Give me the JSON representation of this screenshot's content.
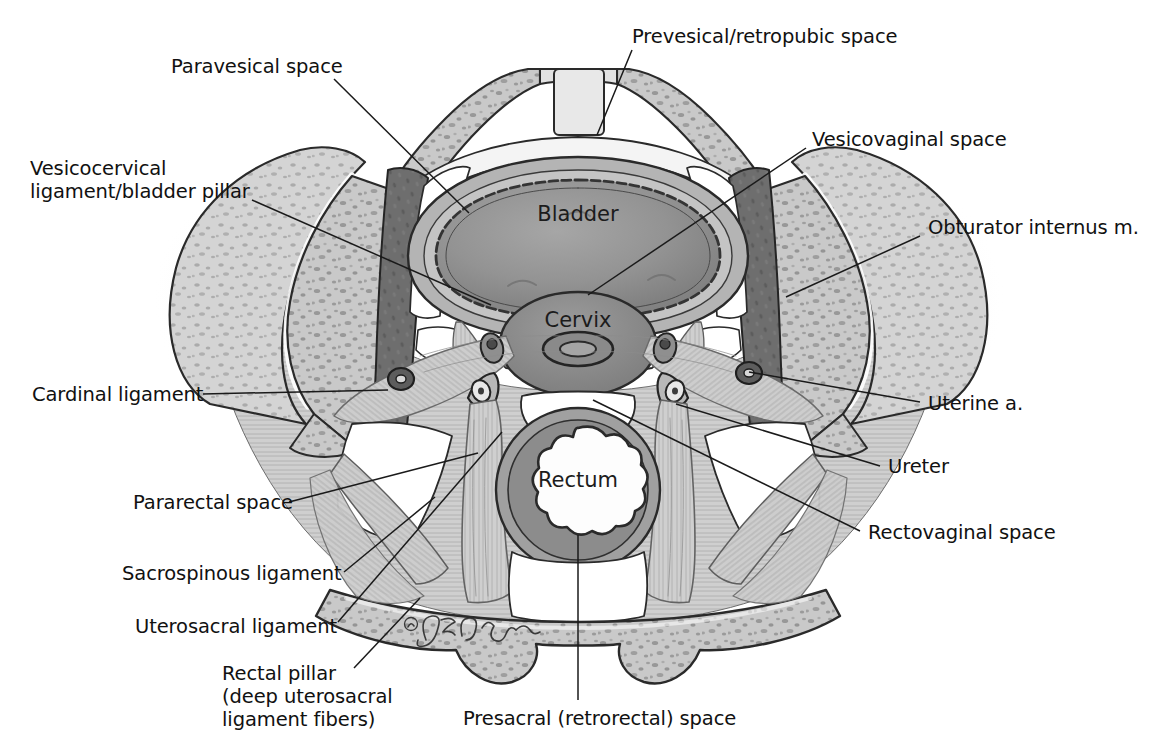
{
  "figure": {
    "signature": "© JE Calver",
    "background_color": "#ffffff",
    "text_color": "#111111",
    "line_color": "#1a1a1a"
  },
  "organ_labels": [
    {
      "id": "bladder",
      "text": "Bladder",
      "x": 578,
      "y": 221
    },
    {
      "id": "cervix",
      "text": "Cervix",
      "x": 578,
      "y": 327
    },
    {
      "id": "rectum",
      "text": "Rectum",
      "x": 578,
      "y": 487
    }
  ],
  "callouts": [
    {
      "id": "paravesical-space",
      "text": "Paravesical space",
      "align": "left",
      "x": 171,
      "y": 55,
      "leader": [
        [
          334,
          79
        ],
        [
          469,
          213
        ]
      ]
    },
    {
      "id": "prevesical-retropubic-space",
      "text": "Prevesical/retropubic space",
      "align": "left",
      "x": 632,
      "y": 25,
      "leader": [
        [
          632,
          50
        ],
        [
          597,
          135
        ]
      ]
    },
    {
      "id": "vesicovaginal-space",
      "text": "Vesicovaginal space",
      "align": "left",
      "x": 812,
      "y": 128,
      "leader": [
        [
          806,
          148
        ],
        [
          588,
          295
        ]
      ]
    },
    {
      "id": "vesicocervical-ligament-bladder-pillar",
      "text": "Vesicocervical\nligament/bladder pillar",
      "align": "left",
      "x": 30,
      "y": 157,
      "leader": [
        [
          252,
          200
        ],
        [
          491,
          305
        ]
      ]
    },
    {
      "id": "obturator-internus-muscle",
      "text": "Obturator internus m.",
      "align": "left",
      "x": 928,
      "y": 216,
      "leader": [
        [
          920,
          236
        ],
        [
          786,
          297
        ]
      ]
    },
    {
      "id": "cardinal-ligament",
      "text": "Cardinal ligament",
      "align": "left",
      "x": 32,
      "y": 383,
      "leader": [
        [
          203,
          394
        ],
        [
          388,
          390
        ]
      ]
    },
    {
      "id": "uterine-artery",
      "text": "Uterine a.",
      "align": "left",
      "x": 928,
      "y": 392,
      "leader": [
        [
          920,
          402
        ],
        [
          749,
          372
        ]
      ]
    },
    {
      "id": "ureter",
      "text": "Ureter",
      "align": "left",
      "x": 888,
      "y": 455,
      "leader": [
        [
          880,
          466
        ],
        [
          676,
          404
        ]
      ]
    },
    {
      "id": "pararectal-space",
      "text": "Pararectal space",
      "align": "left",
      "x": 133,
      "y": 491,
      "leader": [
        [
          289,
          502
        ],
        [
          478,
          453
        ]
      ]
    },
    {
      "id": "rectovaginal-space",
      "text": "Rectovaginal space",
      "align": "left",
      "x": 868,
      "y": 521,
      "leader": [
        [
          860,
          531
        ],
        [
          593,
          400
        ]
      ]
    },
    {
      "id": "sacrospinous-ligament",
      "text": "Sacrospinous ligament",
      "align": "left",
      "x": 122,
      "y": 562,
      "leader": [
        [
          344,
          572
        ],
        [
          435,
          497
        ]
      ]
    },
    {
      "id": "uterosacral-ligament",
      "text": "Uterosacral ligament",
      "align": "left",
      "x": 135,
      "y": 615,
      "leader": [
        [
          338,
          622
        ],
        [
          502,
          432
        ]
      ]
    },
    {
      "id": "rectal-pillar",
      "text": "Rectal pillar\n(deep uterosacral\nligament fibers)",
      "align": "left",
      "x": 222,
      "y": 662,
      "leader": [
        [
          354,
          668
        ],
        [
          420,
          598
        ]
      ]
    },
    {
      "id": "presacral-retrorectal-space",
      "text": "Presacral (retrorectal) space",
      "align": "left",
      "x": 463,
      "y": 707,
      "leader": [
        [
          578,
          700
        ],
        [
          578,
          535
        ]
      ]
    }
  ]
}
